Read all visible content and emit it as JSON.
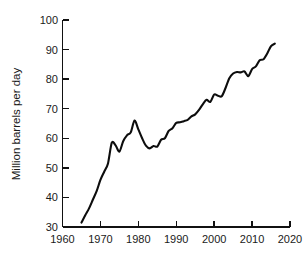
{
  "chart_data": {
    "type": "line",
    "title": "",
    "subtitle": "",
    "xlabel": "",
    "ylabel": "Million barrels per day",
    "xlim": [
      1960,
      2020
    ],
    "ylim": [
      30,
      100
    ],
    "xticks": [
      1960,
      1970,
      1980,
      1990,
      2000,
      2010,
      2020
    ],
    "xtick_labels": [
      "1960",
      "1970",
      "1980",
      "1990",
      "2000",
      "2010",
      "2020"
    ],
    "yticks": [
      30,
      40,
      50,
      60,
      70,
      80,
      90,
      100
    ],
    "ytick_labels": [
      "30",
      "40",
      "50",
      "60",
      "70",
      "80",
      "90",
      "100"
    ],
    "grid": false,
    "legend": false,
    "legend_position": "none",
    "series": [
      {
        "name": "World oil production",
        "color": "#0d0d0d",
        "x": [
          1965,
          1966,
          1967,
          1968,
          1969,
          1970,
          1971,
          1972,
          1973,
          1974,
          1975,
          1976,
          1977,
          1978,
          1979,
          1980,
          1981,
          1982,
          1983,
          1984,
          1985,
          1986,
          1987,
          1988,
          1989,
          1990,
          1991,
          1992,
          1993,
          1994,
          1995,
          1996,
          1997,
          1998,
          1999,
          2000,
          2001,
          2002,
          2003,
          2004,
          2005,
          2006,
          2007,
          2008,
          2009,
          2010,
          2011,
          2012,
          2013,
          2014,
          2015,
          2016
        ],
        "values": [
          31.5,
          34.0,
          36.3,
          39.2,
          42.1,
          45.9,
          48.7,
          51.5,
          58.5,
          57.6,
          55.5,
          59.0,
          61.0,
          62.0,
          66.0,
          63.0,
          60.0,
          57.5,
          56.6,
          57.4,
          57.2,
          59.5,
          60.0,
          62.5,
          63.4,
          65.2,
          65.4,
          65.8,
          66.2,
          67.4,
          68.1,
          69.6,
          71.5,
          73.0,
          72.3,
          74.8,
          74.4,
          74.2,
          77.0,
          80.3,
          81.9,
          82.4,
          82.3,
          82.6,
          81.0,
          83.4,
          84.3,
          86.4,
          86.7,
          88.7,
          91.2,
          92.0
        ]
      }
    ]
  },
  "axes": {
    "y_title": "Million barrels per day"
  }
}
